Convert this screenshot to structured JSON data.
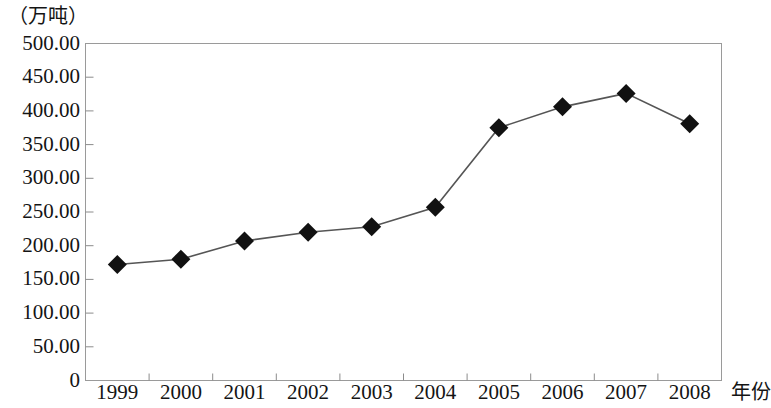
{
  "chart_data": {
    "type": "line",
    "title": "",
    "subtitle": "",
    "unit_label": "（万吨）",
    "xlabel": "年份",
    "ylabel": "",
    "categories": [
      "1999",
      "2000",
      "2001",
      "2002",
      "2003",
      "2004",
      "2005",
      "2006",
      "2007",
      "2008"
    ],
    "values": [
      172,
      180,
      207,
      220,
      228,
      257,
      375,
      406,
      426,
      381
    ],
    "series": [
      {
        "name": "产量",
        "values": [
          172,
          180,
          207,
          220,
          228,
          257,
          375,
          406,
          426,
          381
        ]
      }
    ],
    "ylim": [
      0,
      500
    ],
    "ytick_labels": [
      "0",
      "50.00",
      "100.00",
      "150.00",
      "200.00",
      "250.00",
      "300.00",
      "350.00",
      "400.00",
      "450.00",
      "500.00"
    ],
    "ytick_values": [
      0,
      50,
      100,
      150,
      200,
      250,
      300,
      350,
      400,
      450,
      500
    ],
    "grid": false,
    "legend": "none",
    "marker": "diamond",
    "marker_color": "#111111",
    "line_color": "#555555",
    "axis_color": "#8c8c8c",
    "plot_border": true
  }
}
